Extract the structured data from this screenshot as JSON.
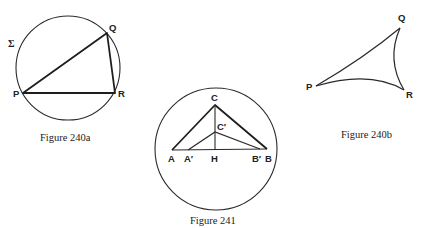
{
  "figures": [
    {
      "id": "240a",
      "caption": "Figure 240a",
      "circle_label": "Σ",
      "points": {
        "P": {
          "label": "P",
          "x": 23,
          "y": 93
        },
        "Q": {
          "label": "Q",
          "x": 107,
          "y": 33
        },
        "R": {
          "label": "R",
          "x": 115,
          "y": 93
        }
      },
      "circle": {
        "cx": 68,
        "cy": 68,
        "r": 52
      }
    },
    {
      "id": "240b",
      "caption": "Figure 240b",
      "points": {
        "P": {
          "label": "P",
          "x": 316,
          "y": 86
        },
        "Q": {
          "label": "Q",
          "x": 400,
          "y": 28
        },
        "R": {
          "label": "R",
          "x": 404,
          "y": 90
        }
      }
    },
    {
      "id": "241",
      "caption": "Figure 241",
      "points": {
        "A": {
          "label": "A",
          "x": 172,
          "y": 150
        },
        "A_prime": {
          "label": "A′",
          "x": 188,
          "y": 150
        },
        "H": {
          "label": "H",
          "x": 215,
          "y": 150
        },
        "B_prime": {
          "label": "B′",
          "x": 260,
          "y": 149
        },
        "B": {
          "label": "B",
          "x": 267,
          "y": 149
        },
        "C": {
          "label": "C",
          "x": 215,
          "y": 105
        },
        "C_prime": {
          "label": "C′",
          "x": 215,
          "y": 132
        }
      },
      "circle": {
        "cx": 216,
        "cy": 149,
        "r": 61
      }
    }
  ]
}
